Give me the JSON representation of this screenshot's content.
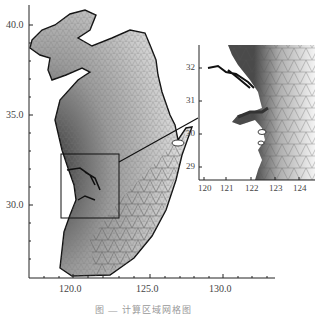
{
  "figure": {
    "main_map": {
      "y_ticks": [
        "40.0",
        "35.0",
        "30.0"
      ],
      "x_ticks": [
        "120.0",
        "125.0",
        "130.0"
      ]
    },
    "inset_map": {
      "y_ticks": [
        "32",
        "31",
        "30",
        "29"
      ],
      "x_ticks": [
        "120",
        "121",
        "122",
        "123",
        "124"
      ]
    },
    "caption": "图 — 计算区域网格图"
  },
  "colors": {
    "mesh_dark": "#3a3a3a",
    "mesh_mid": "#8a8a8a",
    "mesh_light": "#d8d8d8",
    "axis": "#222222"
  }
}
